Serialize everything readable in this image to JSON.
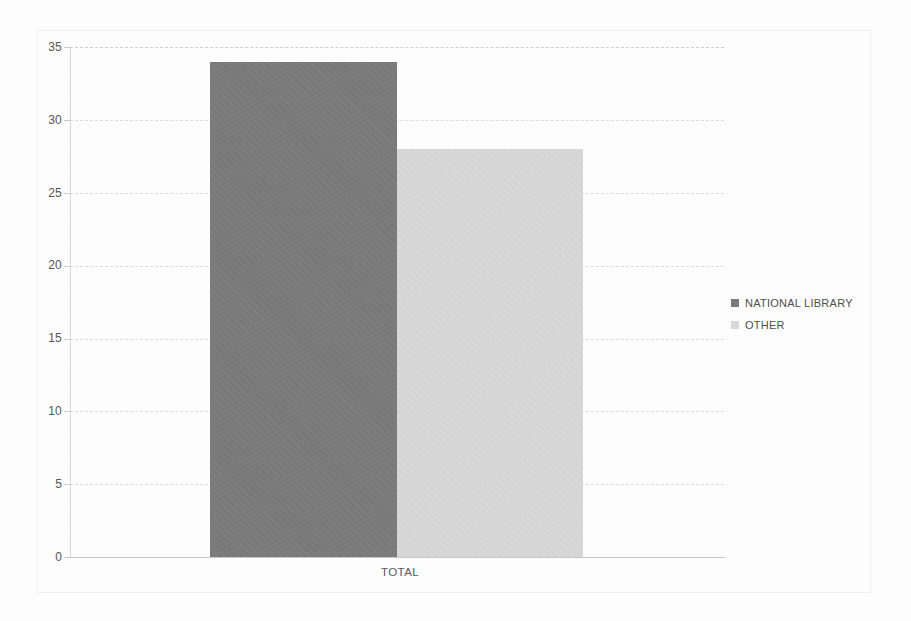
{
  "chart_data": {
    "type": "bar",
    "title": "",
    "subtitle": "",
    "xlabel": "",
    "ylabel": "",
    "categories": [
      "TOTAL"
    ],
    "series": [
      {
        "name": "NATIONAL LIBRARY",
        "values": [
          34
        ],
        "color": "#7b7b7b"
      },
      {
        "name": "OTHER",
        "values": [
          28
        ],
        "color": "#d9d9d9"
      }
    ],
    "ylim": [
      0,
      35
    ],
    "ytick_labels": [
      "0",
      "5",
      "10",
      "15",
      "20",
      "25",
      "30",
      "35"
    ],
    "ytick_values": [
      0,
      5,
      10,
      15,
      20,
      25,
      30,
      35
    ],
    "grid": true,
    "grid_axis": "y",
    "legend_position": "right",
    "annotations": []
  },
  "axes": {
    "y": {
      "ticks": [
        {
          "label": "35",
          "value": 35
        },
        {
          "label": "30",
          "value": 30
        },
        {
          "label": "25",
          "value": 25
        },
        {
          "label": "20",
          "value": 20
        },
        {
          "label": "15",
          "value": 15
        },
        {
          "label": "10",
          "value": 10
        },
        {
          "label": "5",
          "value": 5
        },
        {
          "label": "0",
          "value": 0
        }
      ]
    },
    "x": {
      "ticks": [
        {
          "label": "TOTAL"
        }
      ]
    }
  },
  "legend": {
    "items": [
      {
        "label": "NATIONAL LIBRARY",
        "color": "#7b7b7b"
      },
      {
        "label": "OTHER",
        "color": "#d9d9d9"
      }
    ]
  },
  "colors": {
    "background": "#fdfdfd",
    "series_national_library": "#7b7b7b",
    "series_other": "#d9d9d9",
    "gridline": "#dcdcdc",
    "axis": "#c8c8c8",
    "tick_text": "#575757"
  }
}
